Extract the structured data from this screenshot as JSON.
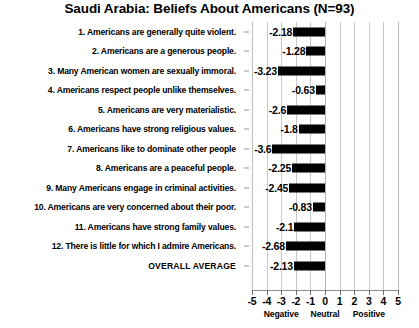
{
  "chart_data": {
    "type": "bar",
    "orientation": "horizontal",
    "title": "Saudi Arabia:  Beliefs About Americans (N=93)",
    "xlabel": "",
    "ylabel": "",
    "xlim": [
      -5,
      5
    ],
    "grid": true,
    "legend": "none",
    "xticks": [
      "-5",
      "-4",
      "-3",
      "-2",
      "-1",
      "0",
      "1",
      "2",
      "3",
      "4",
      "5"
    ],
    "xtick_values": [
      -5,
      -4,
      -3,
      -2,
      -1,
      0,
      1,
      2,
      3,
      4,
      5
    ],
    "band_labels": [
      {
        "text": "Negative",
        "center": -3
      },
      {
        "text": "Neutral",
        "center": 0
      },
      {
        "text": "Positive",
        "center": 3
      }
    ],
    "categories": [
      "1. Americans are generally quite violent.",
      "2. Americans are a generous people.",
      "3. Many American women are sexually immoral.",
      "4. Americans respect people unlike themselves.",
      "5. Americans are very materialistic.",
      "6. Americans have strong religious values.",
      "7. Americans like to dominate other people",
      "8. Americans are a peaceful people.",
      "9. Many Americans engage in criminal activities.",
      "10. Americans are very concerned about their poor.",
      "11. Americans have strong family values.",
      "12. There is little for which I admire Americans.",
      "OVERALL AVERAGE"
    ],
    "values": [
      -2.18,
      -1.28,
      -3.23,
      -0.63,
      -2.6,
      -1.8,
      -3.6,
      -2.25,
      -2.45,
      -0.83,
      -2.1,
      -2.68,
      -2.13
    ],
    "value_labels": [
      "-2.18",
      "-1.28",
      "-3.23",
      "-0.63",
      "-2.6",
      "-1.8",
      "-3.6",
      "-2.25",
      "-2.45",
      "-0.83",
      "-2.1",
      "-2.68",
      "-2.13"
    ],
    "bar_color": "#000000",
    "grid_color": "#c9c9c9",
    "background_color": "#ffffff"
  }
}
